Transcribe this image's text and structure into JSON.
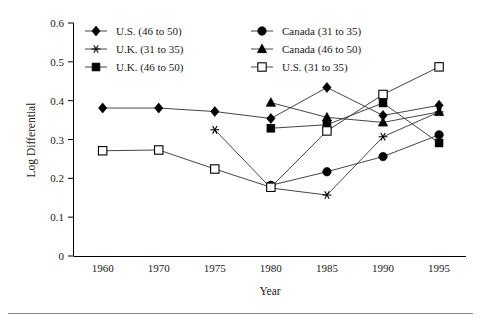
{
  "chart_data": {
    "type": "line",
    "title": "",
    "xlabel": "Year",
    "ylabel": "Log Differential",
    "categories": [
      "1960",
      "1970",
      "1975",
      "1980",
      "1985",
      "1990",
      "1995"
    ],
    "ylim": [
      0,
      0.6
    ],
    "yticks": [
      "0",
      "0.1",
      "0.2",
      "0.3",
      "0.4",
      "0.5",
      "0.6"
    ],
    "ytick_values": [
      0,
      0.1,
      0.2,
      0.3,
      0.4,
      0.5,
      0.6
    ],
    "grid": false,
    "legend_position": "top-inside",
    "series": [
      {
        "name": "U.S. (46 to 50)",
        "marker": "diamond-filled",
        "values": [
          0.381,
          0.381,
          0.372,
          0.354,
          0.434,
          0.362,
          0.388
        ]
      },
      {
        "name": "U.K. (31 to 35)",
        "marker": "asterisk",
        "values": [
          null,
          null,
          0.325,
          0.175,
          0.157,
          0.307,
          0.371
        ]
      },
      {
        "name": "U.K. (46 to 50)",
        "marker": "square-filled",
        "values": [
          null,
          null,
          null,
          0.329,
          0.338,
          0.394,
          0.291
        ]
      },
      {
        "name": "Canada (31 to 35)",
        "marker": "circle-filled",
        "values": [
          null,
          null,
          null,
          0.182,
          0.217,
          0.256,
          0.312
        ]
      },
      {
        "name": "Canada (46 to 50)",
        "marker": "triangle-filled",
        "values": [
          null,
          null,
          null,
          0.395,
          0.357,
          0.344,
          0.371
        ]
      },
      {
        "name": "U.S. (31 to 35)",
        "marker": "square-open",
        "values": [
          0.271,
          0.273,
          0.224,
          0.177,
          0.322,
          0.416,
          0.487
        ]
      }
    ]
  },
  "legend": {
    "entries": [
      {
        "label": "U.S. (46 to 50)",
        "marker": "diamond-filled",
        "column": 0,
        "row": 0
      },
      {
        "label": "U.K. (31 to 35)",
        "marker": "asterisk",
        "column": 0,
        "row": 1
      },
      {
        "label": "U.K. (46 to 50)",
        "marker": "square-filled",
        "column": 0,
        "row": 2
      },
      {
        "label": "Canada (31 to 35)",
        "marker": "circle-filled",
        "column": 1,
        "row": 0
      },
      {
        "label": "Canada (46 to 50)",
        "marker": "triangle-filled",
        "column": 1,
        "row": 1
      },
      {
        "label": "U.S. (31 to 35)",
        "marker": "square-open",
        "column": 1,
        "row": 2
      }
    ]
  },
  "colors": {
    "line": "#303030",
    "marker": "#000000",
    "axis": "#000000",
    "background": "#ffffff",
    "rule": "#8a8a8a"
  }
}
